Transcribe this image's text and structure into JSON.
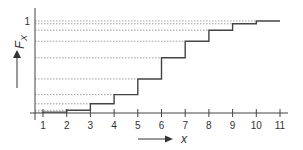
{
  "chart_data": {
    "type": "line",
    "subtype": "step-cdf",
    "title": "",
    "xlabel": "x",
    "ylabel": "F_X",
    "x_ticks": [
      "1",
      "2",
      "3",
      "4",
      "5",
      "6",
      "7",
      "8",
      "9",
      "10",
      "11"
    ],
    "y_ticks": [
      "1"
    ],
    "xlim": [
      1,
      11
    ],
    "ylim": [
      0,
      1
    ],
    "grid": "dotted horizontal lines at each step level",
    "x": [
      1,
      2,
      3,
      4,
      5,
      6,
      7,
      8,
      9,
      10,
      11
    ],
    "values": [
      0.01,
      0.03,
      0.1,
      0.2,
      0.37,
      0.6,
      0.78,
      0.9,
      0.97,
      1.0,
      1.0
    ]
  }
}
